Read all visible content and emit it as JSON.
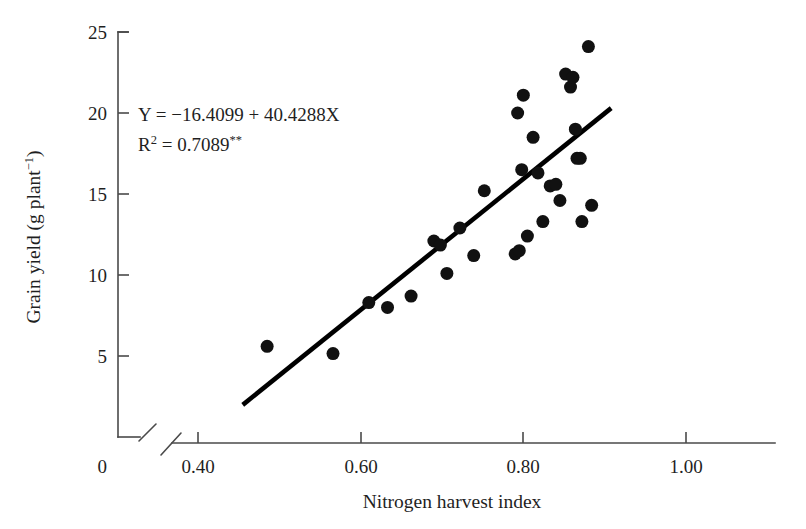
{
  "chart_data": {
    "type": "scatter",
    "title": "",
    "xlabel": "Nitrogen harvest index",
    "ylabel": "Grain yield (g plant−1)",
    "ylabel_parts": {
      "main": "Grain yield (g plant",
      "exponent": "−1",
      "tail": ")"
    },
    "xlim": [
      0.33,
      0.86
    ],
    "ylim": [
      0,
      26
    ],
    "axis_break": {
      "x_axis": true,
      "y_axis": true,
      "origin_label": "0"
    },
    "grid": false,
    "legend": null,
    "xticks": [
      0.4,
      0.6,
      0.8,
      1.0
    ],
    "xtick_labels": [
      "0.40",
      "0.60",
      "0.80",
      "1.00"
    ],
    "yticks": [
      5,
      10,
      15,
      20,
      25
    ],
    "ytick_labels": [
      "5",
      "10",
      "15",
      "20",
      "25"
    ],
    "origin_tick_label": "0",
    "marker": {
      "shape": "circle",
      "color": "#111111",
      "size_px": 13
    },
    "points": [
      {
        "x": 0.485,
        "y": 5.6
      },
      {
        "x": 0.566,
        "y": 5.15
      },
      {
        "x": 0.61,
        "y": 8.3
      },
      {
        "x": 0.633,
        "y": 8.0
      },
      {
        "x": 0.662,
        "y": 8.7
      },
      {
        "x": 0.69,
        "y": 12.1
      },
      {
        "x": 0.698,
        "y": 11.85
      },
      {
        "x": 0.706,
        "y": 10.1
      },
      {
        "x": 0.722,
        "y": 12.9
      },
      {
        "x": 0.739,
        "y": 11.2
      },
      {
        "x": 0.752,
        "y": 15.2
      },
      {
        "x": 0.79,
        "y": 11.3
      },
      {
        "x": 0.795,
        "y": 11.5
      },
      {
        "x": 0.793,
        "y": 20.0
      },
      {
        "x": 0.8,
        "y": 21.1
      },
      {
        "x": 0.798,
        "y": 16.5
      },
      {
        "x": 0.805,
        "y": 12.4
      },
      {
        "x": 0.812,
        "y": 18.5
      },
      {
        "x": 0.818,
        "y": 16.3
      },
      {
        "x": 0.824,
        "y": 13.3
      },
      {
        "x": 0.833,
        "y": 15.5
      },
      {
        "x": 0.84,
        "y": 15.6
      },
      {
        "x": 0.845,
        "y": 14.6
      },
      {
        "x": 0.852,
        "y": 22.4
      },
      {
        "x": 0.858,
        "y": 21.6
      },
      {
        "x": 0.861,
        "y": 22.2
      },
      {
        "x": 0.864,
        "y": 19.0
      },
      {
        "x": 0.866,
        "y": 17.2
      },
      {
        "x": 0.87,
        "y": 17.2
      },
      {
        "x": 0.872,
        "y": 13.3
      },
      {
        "x": 0.88,
        "y": 24.1
      },
      {
        "x": 0.884,
        "y": 14.3
      }
    ],
    "regression": {
      "equation": "Y = −16.4099 + 40.4288X",
      "intercept": -16.4099,
      "slope": 40.4288,
      "r2_label": "R2 = 0.7089**",
      "r2_prefix": "R",
      "r2_exponent": "2",
      "r2_value": " = 0.7089",
      "r2_significance": "**",
      "r_squared": 0.7089,
      "line_x_start": 0.455,
      "line_x_end": 0.908
    },
    "annotations": [
      {
        "name": "regression-equation",
        "text": "Y = −16.4099 + 40.4288X"
      },
      {
        "name": "r-squared",
        "text": "R2 = 0.7089**"
      }
    ]
  }
}
